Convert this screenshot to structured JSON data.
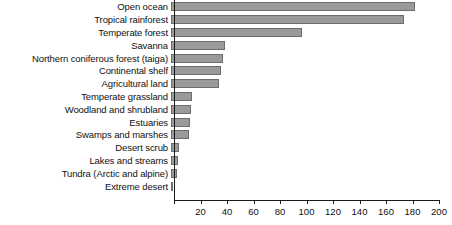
{
  "chart_data": {
    "type": "bar",
    "orientation": "horizontal",
    "title": "",
    "xlabel": "",
    "ylabel": "",
    "xlim": [
      0,
      200
    ],
    "xticks": [
      0,
      20,
      40,
      60,
      80,
      100,
      120,
      140,
      160,
      180,
      200
    ],
    "xtick_labels": [
      "",
      "20",
      "40",
      "60",
      "80",
      "100",
      "120",
      "140",
      "160",
      "180",
      "200"
    ],
    "grid": false,
    "legend": false,
    "bar_color": "#9a9a9a",
    "bar_edge_color": "#6d6d6d",
    "axis_color": "#1a1a1a",
    "categories": [
      "Open ocean",
      "Tropical rainforest",
      "Temperate forest",
      "Savanna",
      "Northern coniferous forest (taiga)",
      "Continental shelf",
      "Agricultural land",
      "Temperate grassland",
      "Woodland and shrubland",
      "Estuaries",
      "Swamps and marshes",
      "Desert scrub",
      "Lakes and streams",
      "Tundra (Arctic and alpine)",
      "Extreme desert"
    ],
    "values": [
      184,
      176,
      99,
      41,
      39,
      38,
      36,
      16,
      15,
      14,
      13.5,
      6,
      5,
      4.5,
      1.5
    ]
  }
}
